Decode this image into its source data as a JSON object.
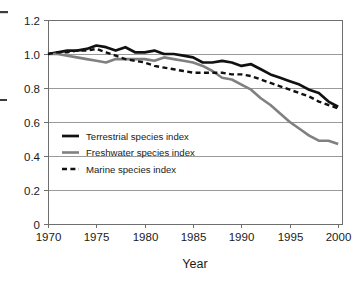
{
  "chart_data": {
    "type": "line",
    "title": "",
    "subtitle": "",
    "xlabel": "Year",
    "ylabel": "",
    "xlim": [
      1970,
      2000.5
    ],
    "ylim": [
      0,
      1.2
    ],
    "grid": "horizontal",
    "legend_position": "inside-lower-left",
    "x_ticks": [
      "1970",
      "1975",
      "1980",
      "1985",
      "1990",
      "1995",
      "2000"
    ],
    "x_tick_values": [
      1970,
      1975,
      1980,
      1985,
      1990,
      1995,
      2000
    ],
    "y_ticks": [
      "0",
      "0.2",
      "0.4",
      "0.6",
      "0.8",
      "1.0",
      "1.2"
    ],
    "y_tick_values": [
      0,
      0.2,
      0.4,
      0.6,
      0.8,
      1.0,
      1.2
    ],
    "x": [
      1970,
      1971,
      1972,
      1973,
      1974,
      1975,
      1976,
      1977,
      1978,
      1979,
      1980,
      1981,
      1982,
      1983,
      1984,
      1985,
      1986,
      1987,
      1988,
      1989,
      1990,
      1991,
      1992,
      1993,
      1994,
      1995,
      1996,
      1997,
      1998,
      1999,
      2000
    ],
    "series": [
      {
        "name": "Terrestrial species index",
        "color": "#111111",
        "style": "solid",
        "width": 2.7,
        "values": [
          1.0,
          1.01,
          1.02,
          1.02,
          1.03,
          1.05,
          1.04,
          1.02,
          1.04,
          1.01,
          1.01,
          1.02,
          1.0,
          1.0,
          0.99,
          0.98,
          0.95,
          0.95,
          0.96,
          0.95,
          0.93,
          0.94,
          0.91,
          0.88,
          0.86,
          0.84,
          0.82,
          0.79,
          0.77,
          0.72,
          0.69
        ]
      },
      {
        "name": "Freshwater species index",
        "color": "#808080",
        "style": "solid",
        "width": 2.6,
        "values": [
          1.0,
          1.0,
          0.99,
          0.98,
          0.97,
          0.96,
          0.95,
          0.97,
          0.97,
          0.97,
          0.97,
          0.96,
          0.98,
          0.97,
          0.96,
          0.95,
          0.93,
          0.9,
          0.86,
          0.85,
          0.82,
          0.79,
          0.74,
          0.7,
          0.65,
          0.6,
          0.56,
          0.52,
          0.49,
          0.49,
          0.47
        ]
      },
      {
        "name": "Marine species index",
        "color": "#111111",
        "style": "dashed",
        "width": 2.4,
        "values": [
          1.0,
          1.01,
          1.01,
          1.02,
          1.02,
          1.03,
          1.01,
          0.99,
          0.97,
          0.96,
          0.95,
          0.93,
          0.92,
          0.91,
          0.9,
          0.89,
          0.89,
          0.89,
          0.89,
          0.88,
          0.88,
          0.87,
          0.85,
          0.83,
          0.81,
          0.79,
          0.77,
          0.75,
          0.72,
          0.7,
          0.68
        ]
      }
    ]
  },
  "legend": {
    "entries": [
      {
        "label": "Terrestrial species index"
      },
      {
        "label": "Freshwater species index"
      },
      {
        "label": "Marine species index"
      }
    ]
  },
  "axis": {
    "x_title": "Year"
  }
}
